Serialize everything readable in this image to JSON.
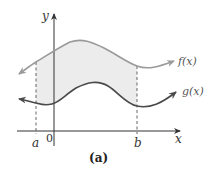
{
  "figure": {
    "caption": "(a)",
    "axes": {
      "x_label": "x",
      "y_label": "y",
      "origin_label": "0"
    },
    "bounds": {
      "a_label": "a",
      "b_label": "b"
    },
    "curves": [
      {
        "name": "f",
        "label": "f(x)",
        "role": "upper",
        "color": "#9a9a9a"
      },
      {
        "name": "g",
        "label": "g(x)",
        "role": "lower",
        "color": "#4a4a4a"
      }
    ],
    "shaded_region": {
      "description": "area between f(x) and g(x) from a to b",
      "color": "#ececec"
    },
    "colors": {
      "axis": "#333333",
      "dashed": "#555555"
    }
  }
}
